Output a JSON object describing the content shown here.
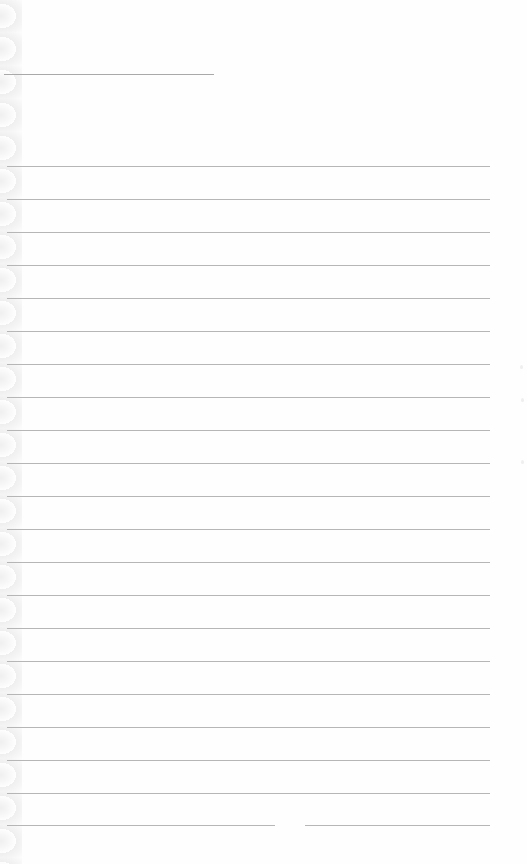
{
  "page": {
    "type": "blank lined notebook page",
    "header_line": {
      "x1": 4,
      "x2": 214,
      "y": 74
    },
    "rules": {
      "count": 21,
      "start_y": 166,
      "spacing": 33,
      "x1": 7,
      "x2": 490,
      "last_line_gap": {
        "from_x": 275,
        "to_x": 305
      }
    },
    "colors": {
      "paper": "#fefefe",
      "rule": "#b6b6b6",
      "header_line": "#a9a9a9"
    }
  }
}
